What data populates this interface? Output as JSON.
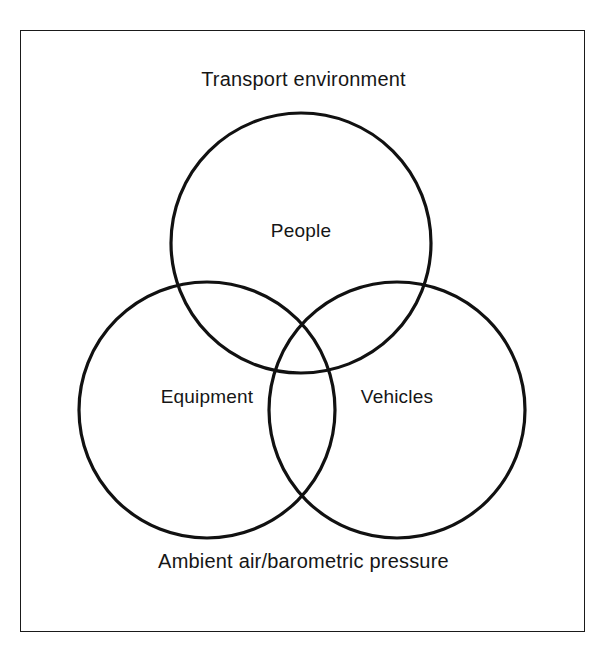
{
  "figure": {
    "type": "venn-diagram-3-set",
    "border_color": "#1a1a1a",
    "stroke_color": "#111111",
    "background": "#ffffff"
  },
  "captions": {
    "top": "Transport environment",
    "bottom": "Ambient air/barometric pressure"
  },
  "sets": [
    {
      "id": "people",
      "label": "People",
      "position": "top",
      "cx": 301,
      "cy": 243,
      "r": 130
    },
    {
      "id": "equipment",
      "label": "Equipment",
      "position": "bottom-left",
      "cx": 207,
      "cy": 410,
      "r": 128
    },
    {
      "id": "vehicles",
      "label": "Vehicles",
      "position": "bottom-right",
      "cx": 397,
      "cy": 410,
      "r": 128
    }
  ]
}
